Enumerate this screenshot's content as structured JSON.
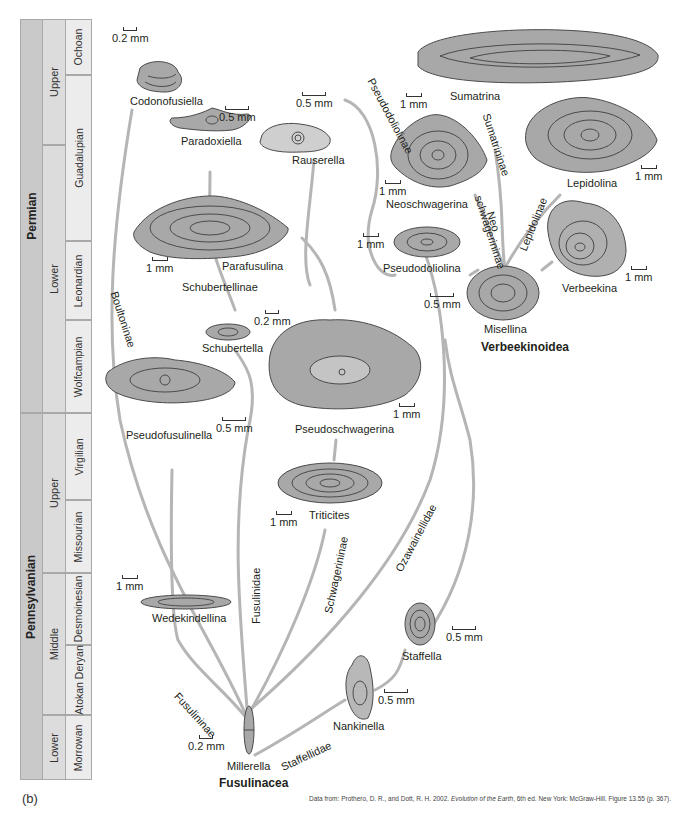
{
  "figure": {
    "panel_label": "(b)",
    "citation_prefix": "Data from: Prothero, D. R., and Dott, R. H. 2002. ",
    "citation_title": "Evolution of the Earth",
    "citation_suffix": ", 6th ed. New York: McGraw-Hill. Figure 13.55 (p. 367)."
  },
  "timescale": {
    "periods": [
      {
        "label": "Permian",
        "top": 0,
        "height": 394
      },
      {
        "label": "Pennsylvanian",
        "top": 394,
        "height": 367
      }
    ],
    "epochs": [
      {
        "label": "Upper",
        "top": 0,
        "height": 126
      },
      {
        "label": "Lower",
        "top": 126,
        "height": 268
      },
      {
        "label": "Upper",
        "top": 394,
        "height": 160
      },
      {
        "label": "Middle",
        "top": 554,
        "height": 142
      },
      {
        "label": "Lower",
        "top": 696,
        "height": 65
      }
    ],
    "stages": [
      {
        "label": "Ochoan",
        "top": 0,
        "height": 56
      },
      {
        "label": "Guadalupian",
        "top": 56,
        "height": 166
      },
      {
        "label": "Leonardian",
        "top": 222,
        "height": 79
      },
      {
        "label": "Wolfcampian",
        "top": 301,
        "height": 93
      },
      {
        "label": "Virgilian",
        "top": 394,
        "height": 87
      },
      {
        "label": "Missourian",
        "top": 481,
        "height": 73
      },
      {
        "label": "Desmoinesian",
        "top": 554,
        "height": 72
      },
      {
        "label": "Atokan Deryan",
        "top": 626,
        "height": 70
      },
      {
        "label": "Morrowan",
        "top": 696,
        "height": 65
      }
    ]
  },
  "groups": {
    "fusulinacea": "Fusulinacea",
    "verbeekinoidea": "Verbeekinoidea"
  },
  "clades": {
    "boultoninae": "Boultoninae",
    "schubertellinae": "Schubertellinae",
    "fusulininae": "Fusulininae",
    "fusulinidae": "Fusulinidae",
    "schwagerininae": "Schwagerininae",
    "ozawainellidae": "Ozawainellidae",
    "staffellidae": "Staffellidae",
    "pseudodoliolinae": "Pseudodoliolinae",
    "sumatrininae": "Sumatrininae",
    "neoschwagerininae_1": "Neo",
    "neoschwagerininae_2": "schwagerininae",
    "lepidolinae": "Lepidolinae"
  },
  "taxa": {
    "codonofusiella": {
      "name": "Codonofusiella",
      "scale": "0.2 mm"
    },
    "paradoxiella": {
      "name": "Paradoxiella",
      "scale": "0.5 mm"
    },
    "rauserella": {
      "name": "Rauserella",
      "scale": "0.5 mm"
    },
    "parafusulina": {
      "name": "Parafusulina",
      "scale": "1 mm"
    },
    "schubertella": {
      "name": "Schubertella",
      "scale": "0.2 mm"
    },
    "pseudofusulinella": {
      "name": "Pseudofusulinella",
      "scale": "0.5 mm"
    },
    "pseudoschwagerina": {
      "name": "Pseudoschwagerina",
      "scale": "1 mm"
    },
    "triticites": {
      "name": "Triticites",
      "scale": "1 mm"
    },
    "wedekindellina": {
      "name": "Wedekindellina",
      "scale": "1 mm"
    },
    "millerella": {
      "name": "Millerella",
      "scale": "0.2 mm"
    },
    "nankinella": {
      "name": "Nankinella",
      "scale": "0.5 mm"
    },
    "staffella": {
      "name": "Staffella",
      "scale": "0.5 mm"
    },
    "sumatrina": {
      "name": "Sumatrina",
      "scale": "1 mm"
    },
    "neoschwagerina": {
      "name": "Neoschwagerina",
      "scale": "1 mm"
    },
    "lepidolina": {
      "name": "Lepidolina",
      "scale": "1 mm"
    },
    "pseudodoliolina": {
      "name": "Pseudodoliolina",
      "scale": "1 mm"
    },
    "misellina": {
      "name": "Misellina",
      "scale": "0.5 mm"
    },
    "verbeekina": {
      "name": "Verbeekina",
      "scale": "1 mm"
    }
  },
  "colors": {
    "branch": "#b5b5b5",
    "fossil_fill": "#a8a8a8",
    "fossil_stroke": "#4a4a4a",
    "period_fill": "#c9c9c9",
    "epoch_fill": "#dcdcdc",
    "stage_fill": "#ececec"
  }
}
